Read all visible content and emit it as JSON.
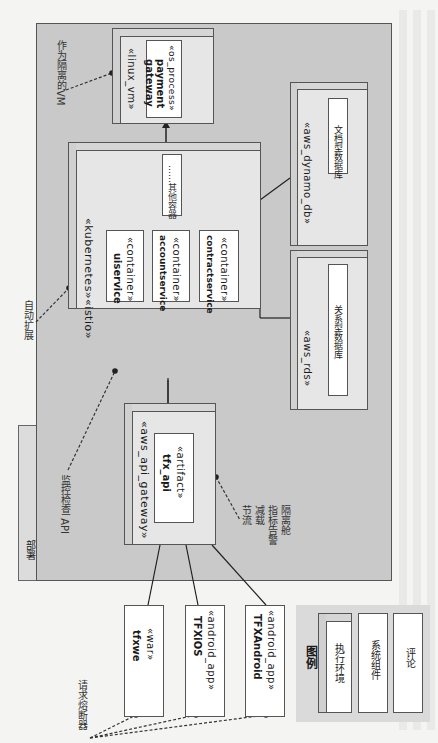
{
  "diagram": {
    "frame_label": "部署",
    "nodes": {
      "linux_vm": {
        "stereotype": "«linux_vm»",
        "inner_stereotype": "«os_process»",
        "inner_name_line1": "payment",
        "inner_name_line2": "gateway"
      },
      "kubernetes": {
        "stereotype": "«kubernetes»«istio»",
        "containers": [
          {
            "stereotype": "«container»",
            "name": "uiservice"
          },
          {
            "stereotype": "«container»",
            "name": "accountservice"
          },
          {
            "stereotype": "«container»",
            "name": "contractservice"
          }
        ],
        "other_doc": "……其他容器"
      },
      "dynamo_db": {
        "stereotype": "«aws_dynamo_db»",
        "doc": "文档型数据库"
      },
      "rds": {
        "stereotype": "«aws_rds»",
        "doc": "关系型数据库"
      },
      "api_gateway": {
        "stereotype": "«aws_api_gateway»",
        "inner_stereotype": "«artifact»",
        "inner_name": "tfx_api"
      }
    },
    "clients": [
      {
        "stereotype": "«war»",
        "name": "tfxwe"
      },
      {
        "stereotype": "«android_app»",
        "name": "TFXiOS"
      },
      {
        "stereotype": "«android_app»",
        "name": "TFXAndroid"
      }
    ],
    "notes": {
      "isolated_vm": "作为隔离的VM",
      "auto_scale": "自动扩展",
      "health_check": "监控检查 API",
      "gateway_features": [
        "节流",
        "减载",
        "指标告警",
        "隔离舱"
      ],
      "circuit_breaker": "请求熔断器"
    },
    "legend": {
      "title": "图例",
      "items": [
        "执行环境",
        "系统组件",
        "评论"
      ]
    }
  },
  "colors": {
    "frame_bg": "#c9c9c9",
    "node_bg": "#e6e6e6",
    "component_bg": "#ffffff",
    "page_bg": "#f4f4f2",
    "line": "#222222"
  }
}
